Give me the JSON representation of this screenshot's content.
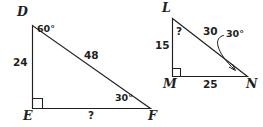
{
  "figure": {
    "background_color": "#ffffff",
    "stroke_color": "#231f20"
  },
  "triangles": [
    {
      "name": "DEF",
      "vertices": {
        "top_label": "D",
        "right_angle_label": "E",
        "right_label": "F"
      },
      "right_angle_at": "E",
      "labels": {
        "leg_vertical": "24",
        "hypotenuse": "48",
        "leg_horizontal": "?",
        "angle_at_top": "60°",
        "angle_at_right": "30°"
      }
    },
    {
      "name": "LMN",
      "vertices": {
        "top_label": "L",
        "right_angle_label": "M",
        "right_label": "N"
      },
      "right_angle_at": "M",
      "labels": {
        "leg_vertical": "15",
        "hypotenuse": "30",
        "leg_horizontal": "25",
        "angle_at_top": "?",
        "angle_at_right": "30°"
      }
    }
  ]
}
